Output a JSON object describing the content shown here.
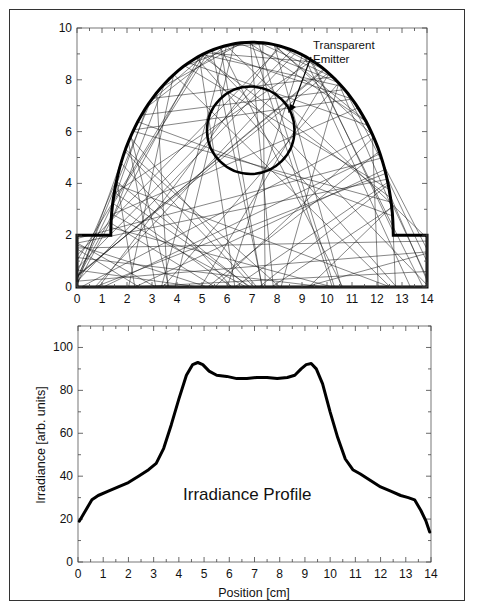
{
  "chart_data": [
    {
      "type": "scatter",
      "subtype": "ray-trace-diagram",
      "title": "",
      "xlabel": "",
      "ylabel": "",
      "xlim": [
        0,
        14
      ],
      "ylim": [
        0,
        10
      ],
      "x_ticks": [
        "0",
        "1",
        "2",
        "3",
        "4",
        "5",
        "6",
        "7",
        "8",
        "9",
        "10",
        "11",
        "12",
        "13",
        "14"
      ],
      "y_ticks": [
        "0",
        "2",
        "4",
        "6",
        "8",
        "10"
      ],
      "grid": false,
      "annotation": {
        "line1": "Transparent",
        "line2": "Emitter"
      },
      "reflector": {
        "outline": [
          [
            0,
            0
          ],
          [
            0,
            2
          ],
          [
            1.35,
            2
          ],
          [
            1.35,
            2.1
          ],
          [
            12.65,
            2.1
          ],
          [
            12.65,
            2
          ],
          [
            14,
            2
          ],
          [
            14,
            0
          ],
          [
            0,
            0
          ]
        ],
        "arch": {
          "center_x": 7,
          "base_y": 2,
          "half_width": 5.65,
          "peak_y": 9.45
        }
      },
      "emitter": {
        "center_x": 6.95,
        "center_y": 6.05,
        "radius": 1.75
      },
      "rays_note": "many random ray segments reflected inside cavity"
    },
    {
      "type": "line",
      "title": "",
      "xlabel": "Position [cm]",
      "ylabel": "Irradiance [arb. units]",
      "xlim": [
        0,
        14
      ],
      "ylim": [
        0,
        110
      ],
      "x_ticks": [
        "0",
        "1",
        "2",
        "3",
        "4",
        "5",
        "6",
        "7",
        "8",
        "9",
        "10",
        "11",
        "12",
        "13",
        "14"
      ],
      "y_ticks": [
        "0",
        "20",
        "40",
        "60",
        "80",
        "100"
      ],
      "grid": false,
      "annotation": "Irradiance Profile",
      "series": [
        {
          "name": "Irradiance",
          "x": [
            0.05,
            0.3,
            0.55,
            0.8,
            1.2,
            1.6,
            2.0,
            2.4,
            2.8,
            3.1,
            3.4,
            3.7,
            4.0,
            4.3,
            4.55,
            4.75,
            4.95,
            5.2,
            5.5,
            5.9,
            6.3,
            6.7,
            7.1,
            7.5,
            7.9,
            8.3,
            8.6,
            8.85,
            9.05,
            9.25,
            9.45,
            9.7,
            10.0,
            10.3,
            10.6,
            10.9,
            11.2,
            11.6,
            12.0,
            12.4,
            12.8,
            13.1,
            13.35,
            13.6,
            13.8,
            13.95
          ],
          "values": [
            19,
            24,
            29,
            31,
            33,
            35,
            37,
            40,
            43,
            46,
            53,
            64,
            76,
            87,
            92,
            93,
            92,
            89,
            87,
            86.5,
            85.5,
            85.5,
            86,
            86,
            85.5,
            86,
            87,
            90,
            92,
            92.5,
            90,
            83,
            70,
            58,
            48,
            43,
            41,
            38,
            35,
            33,
            31,
            30,
            29,
            24,
            19,
            14
          ]
        }
      ]
    }
  ]
}
